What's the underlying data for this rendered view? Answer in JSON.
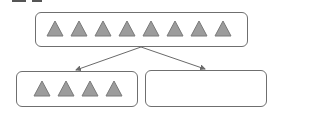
{
  "diagram": {
    "type": "partition-tree",
    "colors": {
      "triangle_fill": "#9c9c9c",
      "triangle_edge": "#7a7a7a",
      "box_border": "#6f6f6f",
      "arrow": "#6a6a6a"
    },
    "top_box": {
      "shape": "triangle",
      "count": 8
    },
    "children": [
      {
        "shape": "triangle",
        "count": 4
      },
      {
        "shape": "triangle",
        "count": 0,
        "empty": true
      }
    ]
  }
}
